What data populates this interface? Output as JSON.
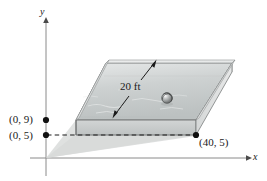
{
  "figure": {
    "kind": "3d-pool-diagram",
    "background_color": "#ffffff",
    "ink_color": "#1a1a1a"
  },
  "axes": {
    "x_label": "x",
    "y_label": "y",
    "axis_color": "#808080",
    "origin": {
      "x": 46,
      "y": 158
    }
  },
  "points": [
    {
      "id": "p09",
      "label": "(0, 9)",
      "x": 0,
      "y": 9
    },
    {
      "id": "p05",
      "label": "(0, 5)",
      "x": 0,
      "y": 5
    },
    {
      "id": "p405",
      "label": "(40, 5)",
      "x": 40,
      "y": 5
    }
  ],
  "dimension": {
    "label": "20 ft",
    "value": 20,
    "unit": "ft",
    "arrow": "double-headed"
  },
  "objects": [
    {
      "name": "ball",
      "shape": "sphere"
    }
  ],
  "colors": {
    "water_fill": "#c9cdcd",
    "wall_fill": "#d8dbdb",
    "rim_fill": "#eceded",
    "shadow_fill": "#dcdedd",
    "outline": "#4a4a4a",
    "axis": "#8a8a8a"
  }
}
